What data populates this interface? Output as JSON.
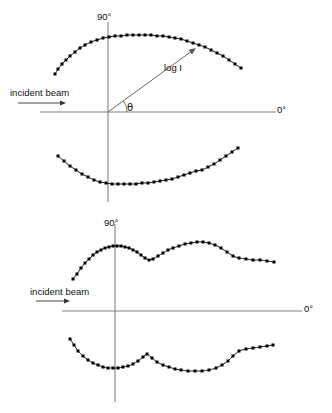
{
  "figure": {
    "type": "polar-scattering-diagram",
    "background_color": "#ffffff",
    "axis_color": "#808080",
    "curve_color": "#1a1a1a",
    "marker_color": "#000000",
    "marker_shape": "square"
  },
  "panels": [
    {
      "id": "top",
      "labels": {
        "vertical_axis": "90°",
        "horizontal_axis": "0°",
        "incident_beam": "incident beam",
        "radius": "log I",
        "angle": "θ"
      },
      "origin": {
        "x": 108,
        "y": 112
      },
      "axes": {
        "horizontal": {
          "x1": 40,
          "y1": 112,
          "x2": 276,
          "y2": 112
        },
        "vertical": {
          "x1": 108,
          "y1": 22,
          "x2": 108,
          "y2": 202
        }
      },
      "beam_arrow": {
        "x1": 18,
        "y1": 103,
        "x2": 66,
        "y2": 103
      },
      "radius_vector": {
        "x1": 108,
        "y1": 112,
        "x2": 196,
        "y2": 48
      },
      "angle_arc": {
        "cx": 108,
        "cy": 112,
        "r": 19,
        "start_deg": 0,
        "end_deg": 36
      },
      "curves": [
        {
          "name": "upper-lobe",
          "points": [
            [
              55,
              74
            ],
            [
              58,
              69
            ],
            [
              62,
              64
            ],
            [
              66,
              60
            ],
            [
              70,
              56
            ],
            [
              75,
              52
            ],
            [
              80,
              48
            ],
            [
              85,
              45
            ],
            [
              91,
              42
            ],
            [
              97,
              40
            ],
            [
              103,
              38
            ],
            [
              109,
              37
            ],
            [
              115,
              36
            ],
            [
              121,
              36
            ],
            [
              127,
              35
            ],
            [
              133,
              35
            ],
            [
              139,
              35
            ],
            [
              145,
              35
            ],
            [
              151,
              35
            ],
            [
              157,
              36
            ],
            [
              163,
              36
            ],
            [
              169,
              37
            ],
            [
              175,
              38
            ],
            [
              181,
              39
            ],
            [
              187,
              41
            ],
            [
              193,
              43
            ],
            [
              199,
              45
            ],
            [
              205,
              47
            ],
            [
              211,
              50
            ],
            [
              217,
              53
            ],
            [
              223,
              56
            ],
            [
              229,
              60
            ],
            [
              235,
              64
            ],
            [
              241,
              68
            ]
          ]
        },
        {
          "name": "lower-lobe",
          "points": [
            [
              58,
              156
            ],
            [
              64,
              161
            ],
            [
              70,
              166
            ],
            [
              76,
              170
            ],
            [
              82,
              174
            ],
            [
              88,
              177
            ],
            [
              94,
              180
            ],
            [
              100,
              182
            ],
            [
              106,
              183
            ],
            [
              112,
              184
            ],
            [
              118,
              184
            ],
            [
              124,
              184
            ],
            [
              130,
              184
            ],
            [
              136,
              184
            ],
            [
              142,
              183
            ],
            [
              148,
              183
            ],
            [
              154,
              182
            ],
            [
              160,
              181
            ],
            [
              166,
              180
            ],
            [
              172,
              179
            ],
            [
              178,
              177
            ],
            [
              184,
              175
            ],
            [
              190,
              173
            ],
            [
              196,
              171
            ],
            [
              202,
              170
            ],
            [
              208,
              167
            ],
            [
              214,
              164
            ],
            [
              220,
              160
            ],
            [
              226,
              156
            ],
            [
              232,
              152
            ],
            [
              238,
              148
            ]
          ]
        }
      ]
    },
    {
      "id": "bottom",
      "labels": {
        "vertical_axis": "90°",
        "horizontal_axis": "0°",
        "incident_beam": "incident beam"
      },
      "origin": {
        "x": 115,
        "y": 105
      },
      "axes": {
        "horizontal": {
          "x1": 62,
          "y1": 105,
          "x2": 302,
          "y2": 105
        },
        "vertical": {
          "x1": 115,
          "y1": 18,
          "x2": 115,
          "y2": 196
        }
      },
      "beam_arrow": {
        "x1": 36,
        "y1": 95,
        "x2": 70,
        "y2": 95
      },
      "curves": [
        {
          "name": "upper-lobe",
          "points": [
            [
              73,
              73
            ],
            [
              77,
              68
            ],
            [
              81,
              62
            ],
            [
              85,
              57
            ],
            [
              89,
              53
            ],
            [
              93,
              49
            ],
            [
              97,
              46
            ],
            [
              101,
              44
            ],
            [
              105,
              42
            ],
            [
              109,
              41
            ],
            [
              113,
              40
            ],
            [
              117,
              40
            ],
            [
              121,
              40
            ],
            [
              125,
              41
            ],
            [
              129,
              42
            ],
            [
              133,
              44
            ],
            [
              137,
              46
            ],
            [
              141,
              49
            ],
            [
              145,
              52
            ],
            [
              149,
              54
            ],
            [
              153,
              53
            ],
            [
              158,
              50
            ],
            [
              163,
              47
            ],
            [
              168,
              44
            ],
            [
              173,
              42
            ],
            [
              179,
              40
            ],
            [
              185,
              38
            ],
            [
              191,
              37
            ],
            [
              197,
              36
            ],
            [
              203,
              36
            ],
            [
              209,
              37
            ],
            [
              215,
              39
            ],
            [
              221,
              42
            ],
            [
              227,
              46
            ],
            [
              233,
              50
            ],
            [
              239,
              52
            ],
            [
              246,
              53
            ],
            [
              253,
              54
            ],
            [
              260,
              54
            ],
            [
              267,
              55
            ],
            [
              274,
              56
            ]
          ]
        },
        {
          "name": "lower-lobe",
          "points": [
            [
              70,
              133
            ],
            [
              74,
              139
            ],
            [
              78,
              145
            ],
            [
              83,
              150
            ],
            [
              88,
              154
            ],
            [
              93,
              157
            ],
            [
              98,
              159
            ],
            [
              103,
              161
            ],
            [
              108,
              162
            ],
            [
              113,
              162
            ],
            [
              118,
              162
            ],
            [
              123,
              161
            ],
            [
              128,
              160
            ],
            [
              133,
              158
            ],
            [
              138,
              155
            ],
            [
              143,
              151
            ],
            [
              147,
              148
            ],
            [
              152,
              152
            ],
            [
              157,
              156
            ],
            [
              163,
              159
            ],
            [
              169,
              161
            ],
            [
              175,
              163
            ],
            [
              181,
              164
            ],
            [
              188,
              165
            ],
            [
              195,
              165
            ],
            [
              202,
              165
            ],
            [
              209,
              164
            ],
            [
              216,
              162
            ],
            [
              222,
              159
            ],
            [
              228,
              155
            ],
            [
              233,
              150
            ],
            [
              239,
              145
            ],
            [
              246,
              143
            ],
            [
              253,
              142
            ],
            [
              260,
              141
            ],
            [
              267,
              140
            ],
            [
              273,
              139
            ]
          ]
        }
      ]
    }
  ]
}
